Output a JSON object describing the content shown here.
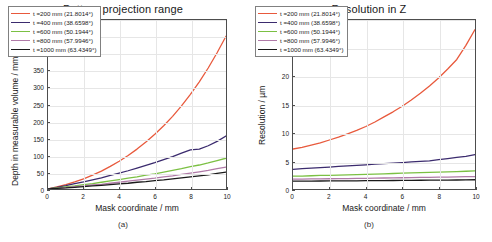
{
  "chart_data": [
    {
      "type": "line",
      "panel": "a",
      "title": "Pattern projection range",
      "xlabel": "Mask coordinate / mm",
      "ylabel": "Depth in measurable volume / mm",
      "xlim": [
        0,
        10
      ],
      "ylim": [
        0,
        500
      ],
      "xticks": [
        0,
        2,
        4,
        6,
        8,
        10
      ],
      "yticks": [
        0,
        50,
        100,
        150,
        200,
        250,
        300,
        350,
        400,
        450,
        500
      ],
      "grid": true,
      "legend_position": "upper left",
      "x": [
        0,
        0.5,
        1,
        1.5,
        2,
        2.5,
        3,
        3.5,
        4,
        4.5,
        5,
        5.5,
        6,
        6.5,
        7,
        7.5,
        8,
        8.5,
        9,
        9.5,
        10
      ],
      "series": [
        {
          "name": "t =200 mm (21.8014°)",
          "color": "#e8593c",
          "values": [
            0,
            6,
            13,
            21,
            30,
            41,
            53,
            67,
            82,
            99,
            118,
            139,
            162,
            187,
            215,
            246,
            280,
            317,
            358,
            403,
            452
          ]
        },
        {
          "name": "t =400 mm (38.6598°)",
          "color": "#3b2b6e",
          "values": [
            0,
            5,
            10,
            16,
            21,
            27,
            33,
            40,
            47,
            54,
            62,
            70,
            78,
            87,
            96,
            106,
            116,
            118,
            128,
            141,
            157
          ]
        },
        {
          "name": "t =600 mm (50.1944°)",
          "color": "#7bc043",
          "values": [
            0,
            3,
            6,
            9,
            13,
            16,
            20,
            24,
            28,
            32,
            36,
            41,
            45,
            50,
            55,
            60,
            66,
            71,
            77,
            84,
            91
          ]
        },
        {
          "name": "t =800 mm (57.9946°)",
          "color": "#b07aa8",
          "values": [
            0,
            2,
            4,
            7,
            9,
            12,
            14,
            17,
            20,
            23,
            26,
            29,
            32,
            36,
            39,
            43,
            47,
            51,
            55,
            60,
            65
          ]
        },
        {
          "name": "t =1000 mm (63.4349°)",
          "color": "#1a1a1a",
          "values": [
            0,
            2,
            3,
            5,
            7,
            9,
            11,
            13,
            15,
            17,
            20,
            22,
            25,
            27,
            30,
            33,
            36,
            39,
            42,
            46,
            50
          ]
        }
      ]
    },
    {
      "type": "line",
      "panel": "b",
      "title": "Resolution in Z",
      "xlabel": "Mask coordinate / mm",
      "ylabel": "Resolution / µm",
      "xlim": [
        0,
        10
      ],
      "ylim": [
        0,
        30
      ],
      "xticks": [
        0,
        2,
        4,
        6,
        8,
        10
      ],
      "yticks": [
        0,
        5,
        10,
        15,
        20,
        25,
        30
      ],
      "grid": true,
      "legend_position": "upper left",
      "x": [
        0,
        0.5,
        1,
        1.5,
        2,
        2.5,
        3,
        3.5,
        4,
        4.5,
        5,
        5.5,
        6,
        6.5,
        7,
        7.5,
        8,
        8.5,
        9,
        9.5,
        10
      ],
      "series": [
        {
          "name": "t =200 mm (21.8014°)",
          "color": "#e8593c",
          "values": [
            7.1,
            7.4,
            7.8,
            8.2,
            8.7,
            9.2,
            9.8,
            10.4,
            11.1,
            11.9,
            12.8,
            13.7,
            14.7,
            15.8,
            17.0,
            18.3,
            19.7,
            21.3,
            23.0,
            25.5,
            28.3
          ]
        },
        {
          "name": "t =400 mm (38.6598°)",
          "color": "#3b2b6e",
          "values": [
            3.5,
            3.6,
            3.7,
            3.8,
            3.9,
            4.0,
            4.1,
            4.2,
            4.3,
            4.4,
            4.5,
            4.6,
            4.7,
            4.8,
            4.9,
            5.0,
            5.2,
            5.4,
            5.6,
            5.8,
            6.1
          ]
        },
        {
          "name": "t =600 mm (50.1944°)",
          "color": "#7bc043",
          "values": [
            2.3,
            2.3,
            2.35,
            2.4,
            2.4,
            2.45,
            2.5,
            2.55,
            2.6,
            2.65,
            2.7,
            2.75,
            2.8,
            2.85,
            2.9,
            2.95,
            3.0,
            3.05,
            3.1,
            3.15,
            3.2
          ]
        },
        {
          "name": "t =800 mm (57.9946°)",
          "color": "#b07aa8",
          "values": [
            1.75,
            1.76,
            1.78,
            1.8,
            1.82,
            1.84,
            1.86,
            1.88,
            1.9,
            1.92,
            1.95,
            1.97,
            2.0,
            2.02,
            2.05,
            2.07,
            2.1,
            2.12,
            2.15,
            2.18,
            2.2
          ]
        },
        {
          "name": "t =1000 mm (63.4349°)",
          "color": "#1a1a1a",
          "values": [
            1.4,
            1.4,
            1.41,
            1.42,
            1.43,
            1.44,
            1.45,
            1.46,
            1.47,
            1.48,
            1.5,
            1.51,
            1.52,
            1.53,
            1.55,
            1.56,
            1.58,
            1.59,
            1.6,
            1.62,
            1.64
          ]
        }
      ]
    }
  ],
  "panel_a": {
    "title": "Pattern projection range",
    "xlabel": "Mask coordinate / mm",
    "ylabel": "Depth in measurable volume / mm",
    "sublabel": "(a)",
    "xticks": [
      "0",
      "2",
      "4",
      "6",
      "8",
      "10"
    ],
    "yticks": [
      "0",
      "50",
      "100",
      "150",
      "200",
      "250",
      "300",
      "350",
      "400",
      "450",
      "500"
    ],
    "legend": [
      "t =200 mm (21.8014°)",
      "t =400 mm (38.6598°)",
      "t =600 mm (50.1944°)",
      "t =800 mm (57.9946°)",
      "t =1000 mm (63.4349°)"
    ]
  },
  "panel_b": {
    "title": "Resolution in Z",
    "xlabel": "Mask coordinate / mm",
    "ylabel": "Resolution / µm",
    "sublabel": "(b)",
    "xticks": [
      "0",
      "2",
      "4",
      "6",
      "8",
      "10"
    ],
    "yticks": [
      "0",
      "5",
      "10",
      "15",
      "20",
      "25",
      "30"
    ],
    "legend": [
      "t =200 mm (21.8014°)",
      "t =400 mm (38.6598°)",
      "t =600 mm (50.1944°)",
      "t =800 mm (57.9946°)",
      "t =1000 mm (63.4349°)"
    ]
  },
  "colors": {
    "series_1": "#e8593c",
    "series_2": "#3b2b6e",
    "series_3": "#7bc043",
    "series_4": "#b07aa8",
    "series_5": "#1a1a1a",
    "axis": "#4d4d4d",
    "grid": "#e6e6e6",
    "background": "#ffffff"
  }
}
